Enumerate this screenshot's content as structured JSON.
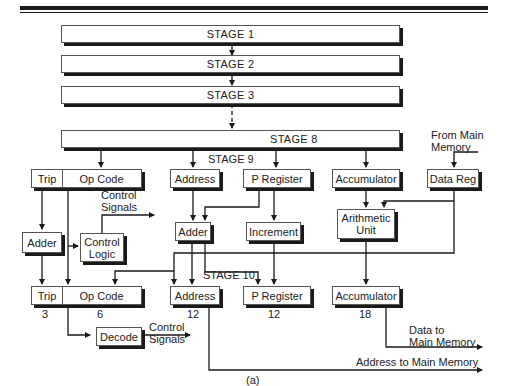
{
  "stages": {
    "s1": "STAGE 1",
    "s2": "STAGE 2",
    "s3": "STAGE 3",
    "s8": "STAGE 8",
    "s9": "STAGE 9",
    "s10": "STAGE 10"
  },
  "top_registers": {
    "trip": "Trip",
    "op_code": "Op Code",
    "address": "Address",
    "p_register": "P Register",
    "accumulator": "Accumulator",
    "data_reg": "Data Reg"
  },
  "middle_units": {
    "adder_left": "Adder",
    "control_logic": "Control Logic",
    "adder_center": "Adder",
    "increment": "Increment",
    "arithmetic_unit": "Arithmetic Unit"
  },
  "bottom_registers": {
    "trip": "Trip",
    "op_code": "Op Code",
    "address": "Address",
    "p_register": "P Register",
    "accumulator": "Accumulator",
    "decode": "Decode"
  },
  "bit_widths": {
    "trip": "3",
    "op_code": "6",
    "address": "12",
    "p_register": "12",
    "accumulator": "18"
  },
  "labels": {
    "from_main_memory_1": "From Main",
    "from_main_memory_2": "Memory",
    "control_signals_top_1": "Control",
    "control_signals_top_2": "Signals",
    "control_signals_bottom_1": "Control",
    "control_signals_bottom_2": "Signals",
    "data_to_memory_1": "Data to",
    "data_to_memory_2": "Main Memory",
    "address_to_memory": "Address to Main Memory",
    "caption": "(a)"
  }
}
